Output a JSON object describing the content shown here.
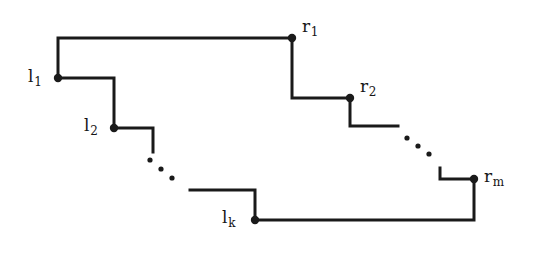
{
  "figure": {
    "kind": "staircase-polygon-diagram",
    "width": 541,
    "height": 258,
    "background_color": "#ffffff",
    "ink_color": "#1a1a1a",
    "stroke_width": 3,
    "vertex_dot_radius": 4.2,
    "labels": {
      "l1": {
        "base": "l",
        "sub": "1"
      },
      "l2": {
        "base": "l",
        "sub": "2"
      },
      "lk": {
        "base": "l",
        "sub": "k"
      },
      "r1": {
        "base": "r",
        "sub": "1"
      },
      "r2": {
        "base": "r",
        "sub": "2"
      },
      "rm": {
        "base": "r",
        "sub": "m"
      }
    },
    "vertices": [
      {
        "name": "l1",
        "x": 58,
        "y": 78
      },
      {
        "name": "l2",
        "x": 114,
        "y": 128
      },
      {
        "name": "lk",
        "x": 255,
        "y": 220
      },
      {
        "name": "r1",
        "x": 292,
        "y": 38
      },
      {
        "name": "r2",
        "x": 350,
        "y": 98
      },
      {
        "name": "rm",
        "x": 474,
        "y": 179
      }
    ],
    "paths": {
      "upper_left_step": "M 58,78 L 58,38 L 292,38",
      "l1_to_l2_step": "M 58,78 L 114,78 L 114,128",
      "l2_stub": "M 114,128 L 153,128 L 153,152",
      "lk_step": "M 190,190 L 255,190 L 255,220",
      "r1_to_r2_step": "M 292,38 L 292,98 L 350,98",
      "r2_stub": "M 350,98 L 350,126 L 398,126",
      "rm_step": "M 440,168 L 440,179 L 474,179",
      "bottom_right_closure": "M 474,179 L 474,220 L 255,220"
    },
    "ellipses": [
      {
        "name": "lower-left-ellipsis",
        "dots": [
          {
            "x": 150,
            "y": 160
          },
          {
            "x": 161,
            "y": 169
          },
          {
            "x": 172,
            "y": 178
          }
        ],
        "radius": 2.6
      },
      {
        "name": "lower-right-ellipsis",
        "dots": [
          {
            "x": 407,
            "y": 138
          },
          {
            "x": 418,
            "y": 146
          },
          {
            "x": 429,
            "y": 154
          }
        ],
        "radius": 2.6
      }
    ]
  }
}
